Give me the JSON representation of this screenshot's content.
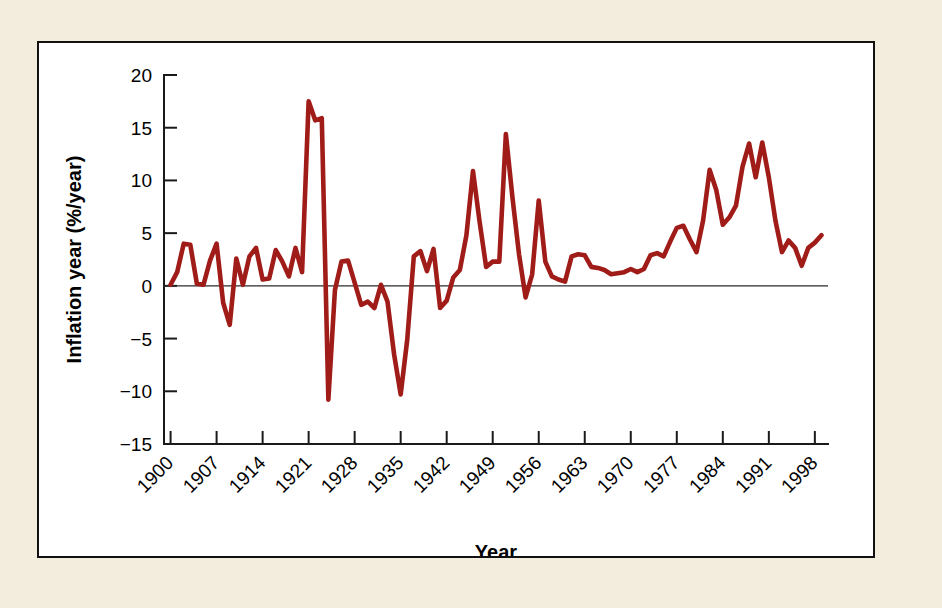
{
  "figure": {
    "background_color": "#f2eddc",
    "panel_color": "#ffffff",
    "border_color": "#111111"
  },
  "chart_data": {
    "type": "line",
    "title": "",
    "subtitle": "",
    "xlabel": "Year",
    "ylabel": "Inflation year (%/year)",
    "xlim": [
      1899,
      2000
    ],
    "ylim": [
      -15,
      20
    ],
    "grid": false,
    "legend": "none",
    "line_color": "#a01c18",
    "zero_reference_line": 0,
    "y_ticks": [
      20,
      15,
      10,
      5,
      0,
      -5,
      -10,
      -15
    ],
    "y_tick_labels": [
      "20",
      "15",
      "10",
      "5",
      "0",
      "−5",
      "−10",
      "−15"
    ],
    "x_ticks": [
      1900,
      1907,
      1914,
      1921,
      1928,
      1935,
      1942,
      1949,
      1956,
      1963,
      1970,
      1977,
      1984,
      1991,
      1998
    ],
    "x_tick_labels": [
      "1900",
      "1907",
      "1914",
      "1921",
      "1928",
      "1935",
      "1942",
      "1949",
      "1956",
      "1963",
      "1970",
      "1977",
      "1984",
      "1991",
      "1998"
    ],
    "x": [
      1900,
      1901,
      1902,
      1903,
      1904,
      1905,
      1906,
      1907,
      1908,
      1909,
      1910,
      1911,
      1912,
      1913,
      1914,
      1915,
      1916,
      1917,
      1918,
      1919,
      1920,
      1921,
      1922,
      1923,
      1924,
      1925,
      1926,
      1927,
      1928,
      1929,
      1930,
      1931,
      1932,
      1933,
      1934,
      1935,
      1936,
      1937,
      1938,
      1939,
      1940,
      1941,
      1942,
      1943,
      1944,
      1945,
      1946,
      1947,
      1948,
      1949,
      1950,
      1951,
      1952,
      1953,
      1954,
      1955,
      1956,
      1957,
      1958,
      1959,
      1960,
      1961,
      1962,
      1963,
      1964,
      1965,
      1966,
      1967,
      1968,
      1969,
      1970,
      1971,
      1972,
      1973,
      1974,
      1975,
      1976,
      1977,
      1978,
      1979,
      1980,
      1981,
      1982,
      1983,
      1984,
      1985,
      1986,
      1987,
      1988,
      1989,
      1990,
      1991,
      1992,
      1993,
      1994,
      1995,
      1996,
      1997,
      1998,
      1999
    ],
    "y": [
      0.1,
      1.3,
      4.0,
      3.9,
      0.2,
      0.1,
      2.4,
      4.0,
      -1.6,
      -3.7,
      2.6,
      0.1,
      2.8,
      3.6,
      0.6,
      0.7,
      3.4,
      2.3,
      0.9,
      3.6,
      1.3,
      17.5,
      15.7,
      15.9,
      -10.8,
      -0.4,
      2.3,
      2.4,
      0.3,
      -1.8,
      -1.5,
      -2.1,
      0.1,
      -1.5,
      -6.5,
      -10.3,
      -5.1,
      2.8,
      3.3,
      1.4,
      3.5,
      -2.1,
      -1.4,
      0.8,
      1.5,
      4.8,
      10.9,
      6.1,
      1.8,
      2.3,
      2.3,
      14.4,
      8.4,
      3.0,
      -1.1,
      1.1,
      8.1,
      2.3,
      0.9,
      0.6,
      0.4,
      2.8,
      3.0,
      2.9,
      1.8,
      1.7,
      1.5,
      1.1,
      1.2,
      1.3,
      1.6,
      1.3,
      1.6,
      2.9,
      3.1,
      2.8,
      4.2,
      5.5,
      5.7,
      4.4,
      3.2,
      6.2,
      11.0,
      9.1,
      5.8,
      6.5,
      7.6,
      11.3,
      13.5,
      10.3,
      13.6,
      10.3,
      6.2,
      3.2,
      4.3,
      3.6,
      1.9,
      3.6,
      4.1,
      4.8,
      5.4,
      4.2,
      3.0,
      3.0,
      2.6,
      2.8,
      2.9,
      2.3,
      1.6,
      2.3
    ]
  }
}
